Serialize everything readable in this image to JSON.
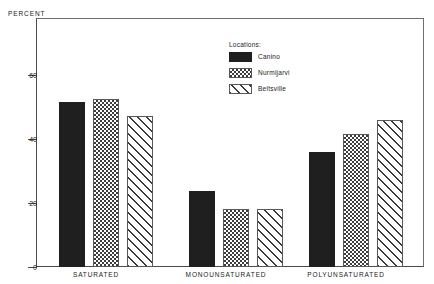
{
  "chart_data": {
    "type": "bar",
    "title": "",
    "xlabel": "",
    "ylabel": "PERCENT",
    "ylim": [
      0,
      70
    ],
    "yticks": [
      0,
      20,
      40,
      60
    ],
    "ytick_labels": [
      "0",
      "20",
      "40",
      "60"
    ],
    "grid": false,
    "legend_position": "inside-top-center",
    "legend_title": "Locations:",
    "categories": [
      "SATURATED",
      "MONOUNSATURATED",
      "POLYUNSATURATED"
    ],
    "series": [
      {
        "name": "Canino",
        "pattern": "solid-black",
        "values": [
          46.5,
          21.5,
          32.5
        ]
      },
      {
        "name": "Nurmijarvi",
        "pattern": "checkered",
        "values": [
          47.5,
          16.5,
          37.5
        ]
      },
      {
        "name": "Beltsville",
        "pattern": "diagonal-hatch",
        "values": [
          42.5,
          16.5,
          41.5
        ]
      }
    ]
  },
  "axis": {
    "y_title": "PERCENT"
  },
  "legend": {
    "title": "Locations:",
    "items": [
      {
        "label": "Canino"
      },
      {
        "label": "Nurmijarvi"
      },
      {
        "label": "Beltsville"
      }
    ]
  },
  "xaxis": {
    "labels": [
      "SATURATED",
      "MONOUNSATURATED",
      "POLYUNSATURATED"
    ]
  },
  "yaxis": {
    "labels": [
      "60",
      "40",
      "20",
      "0"
    ]
  }
}
